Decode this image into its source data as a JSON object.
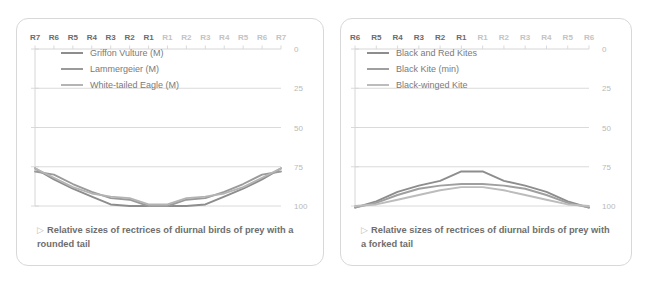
{
  "panels": [
    {
      "id": "rounded-tail",
      "caption_bullet": "▷",
      "caption": "Relative sizes of rectrices of diurnal birds of prey with a rounded tail",
      "legend": [
        {
          "label": "Griffon Vulture (M)",
          "color": "#8d8d8d"
        },
        {
          "label": "Lammergeier (M)",
          "color": "#9a9a9a"
        },
        {
          "label": "White-tailed Eagle (M)",
          "color": "#b4b4b4"
        }
      ],
      "chart_data": {
        "type": "line",
        "title": "Relative sizes of rectrices of diurnal birds of prey with a rounded tail",
        "xlabel": "",
        "ylabel": "",
        "ylim": [
          0,
          100
        ],
        "y_inverted": true,
        "yticks": [
          0,
          25,
          50,
          75,
          100
        ],
        "grid": true,
        "legend_position": "top-left",
        "categories": [
          "R7",
          "R6",
          "R5",
          "R4",
          "R3",
          "R2",
          "R1",
          "R1",
          "R2",
          "R3",
          "R4",
          "R5",
          "R6",
          "R7"
        ],
        "categories_side": [
          "left",
          "left",
          "left",
          "left",
          "left",
          "left",
          "left",
          "right",
          "right",
          "right",
          "right",
          "right",
          "right",
          "right"
        ],
        "series": [
          {
            "name": "Griffon Vulture (M)",
            "color": "#8d8d8d",
            "values": [
              76,
              83,
              89,
              94,
              99,
              100,
              100,
              100,
              100,
              99,
              94,
              89,
              83,
              76
            ]
          },
          {
            "name": "Lammergeier (M)",
            "color": "#9a9a9a",
            "values": [
              78,
              80,
              86,
              91,
              95,
              96,
              100,
              100,
              96,
              95,
              91,
              86,
              80,
              78
            ]
          },
          {
            "name": "White-tailed Eagle (M)",
            "color": "#b4b4b4",
            "values": [
              76,
              82,
              88,
              92,
              94,
              95,
              99,
              99,
              95,
              94,
              92,
              88,
              82,
              76
            ]
          }
        ]
      }
    },
    {
      "id": "forked-tail",
      "caption_bullet": "▷",
      "caption": "Relative sizes of rectrices of diurnal birds of prey with a forked tail",
      "legend": [
        {
          "label": "Black and Red Kites",
          "color": "#8d8d8d"
        },
        {
          "label": "Black Kite (min)",
          "color": "#9f9f9f"
        },
        {
          "label": "Black-winged Kite",
          "color": "#bcbcbc"
        }
      ],
      "chart_data": {
        "type": "line",
        "title": "Relative sizes of rectrices of diurnal birds of prey with a forked tail",
        "xlabel": "",
        "ylabel": "",
        "ylim": [
          0,
          100
        ],
        "y_inverted": true,
        "yticks": [
          0,
          25,
          50,
          75,
          100
        ],
        "grid": true,
        "legend_position": "top-left",
        "categories": [
          "R6",
          "R5",
          "R4",
          "R3",
          "R2",
          "R1",
          "R1",
          "R2",
          "R3",
          "R4",
          "R5",
          "R6"
        ],
        "categories_side": [
          "left",
          "left",
          "left",
          "left",
          "left",
          "left",
          "right",
          "right",
          "right",
          "right",
          "right",
          "right"
        ],
        "series": [
          {
            "name": "Black and Red Kites",
            "color": "#8d8d8d",
            "values": [
              101,
              97,
              91,
              87,
              84,
              78,
              78,
              84,
              87,
              91,
              97,
              101
            ]
          },
          {
            "name": "Black Kite (min)",
            "color": "#9f9f9f",
            "values": [
              101,
              98,
              93,
              89,
              87,
              86,
              86,
              87,
              89,
              93,
              98,
              101
            ]
          },
          {
            "name": "Black-winged Kite",
            "color": "#bcbcbc",
            "values": [
              100,
              99,
              96,
              93,
              90,
              88,
              88,
              90,
              93,
              96,
              99,
              100
            ]
          }
        ]
      }
    }
  ],
  "axis": {
    "tick_labels": [
      "0",
      "25",
      "50",
      "75",
      "100"
    ],
    "grid_color": "#d6d6d6",
    "label_color": "#b9b9b9"
  }
}
